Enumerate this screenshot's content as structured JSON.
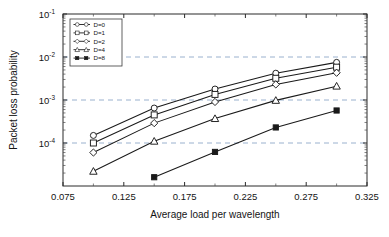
{
  "chart_data": {
    "type": "line",
    "title": "",
    "xlabel": "Average load per wavelength",
    "ylabel": "Packet loss probability",
    "xscale": "linear",
    "yscale": "log",
    "xlim": [
      0.075,
      0.325
    ],
    "ylim": [
      1e-05,
      0.1
    ],
    "xticks": [
      0.075,
      0.125,
      0.175,
      0.225,
      0.275,
      0.325
    ],
    "xtick_labels": [
      "0.075",
      "0.125",
      "0.175",
      "0.225",
      "0.275",
      "0.325"
    ],
    "yticks": [
      0.0001,
      0.001,
      0.01,
      0.1
    ],
    "ytick_labels": [
      "10-4",
      "10-3",
      "10-2",
      "10-1"
    ],
    "ytick_bases": [
      "10",
      "10",
      "10",
      "10"
    ],
    "ytick_exps": [
      "-4",
      "-3",
      "-2",
      "-1"
    ],
    "grid": "horizontal dashed at 1e-4, 1e-3, 1e-2",
    "gridlines_y": [
      0.0001,
      0.001,
      0.01
    ],
    "legend_position": "upper left inside axes",
    "x": [
      0.1,
      0.15,
      0.2,
      0.25,
      0.3
    ],
    "series": [
      {
        "name": "D=0",
        "marker": "circle-open",
        "x": [
          0.1,
          0.15,
          0.2,
          0.25,
          0.3
        ],
        "values": [
          0.00015,
          0.00065,
          0.0018,
          0.0042,
          0.0075
        ]
      },
      {
        "name": "D=1",
        "marker": "square-open",
        "x": [
          0.1,
          0.15,
          0.2,
          0.25,
          0.3
        ],
        "values": [
          0.0001,
          0.00045,
          0.00135,
          0.0032,
          0.0058
        ]
      },
      {
        "name": "D=2",
        "marker": "diamond-open",
        "x": [
          0.1,
          0.15,
          0.2,
          0.25,
          0.3
        ],
        "values": [
          6e-05,
          0.00029,
          0.0009,
          0.0023,
          0.0043
        ]
      },
      {
        "name": "D=4",
        "marker": "triangle-open",
        "x": [
          0.1,
          0.15,
          0.2,
          0.25,
          0.3
        ],
        "values": [
          2.2e-05,
          0.00011,
          0.00037,
          0.00098,
          0.0021
        ]
      },
      {
        "name": "D=8",
        "marker": "square-filled",
        "x": [
          0.15,
          0.2,
          0.25,
          0.3
        ],
        "values": [
          1.6e-05,
          6.2e-05,
          0.00023,
          0.00057
        ]
      }
    ]
  },
  "legend": {
    "items": [
      {
        "label": "D=0"
      },
      {
        "label": "D=1"
      },
      {
        "label": "D=2"
      },
      {
        "label": "D=4"
      },
      {
        "label": "D=8"
      }
    ]
  },
  "colors": {
    "line": "#1a1a1a",
    "grid": "#8fa8c8",
    "axis": "#2b2b2b",
    "background": "#ffffff"
  }
}
